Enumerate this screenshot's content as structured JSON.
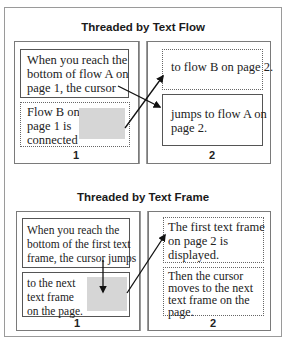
{
  "top_panel": {
    "title": "Threaded by Text Flow",
    "page1": {
      "number": "1",
      "flow_a_text": "When you reach the\nbottom of flow A on\npage 1, the cursor",
      "flow_b_text": "Flow B on\npage 1 is\nconnected"
    },
    "page2": {
      "number": "2",
      "flow_b_text": "to flow B on page 2.",
      "flow_a_text": "jumps to flow A on\npage 2."
    }
  },
  "bottom_panel": {
    "title": "Threaded by Text Frame",
    "page1": {
      "number": "1",
      "frame1_text": "When you reach the\nbottom of the first text\nframe, the cursor jumps",
      "frame2_text": "to the next\ntext frame\non the page."
    },
    "page2": {
      "number": "2",
      "frame1_text": "The first text frame\non page 2 is\ndisplayed.",
      "frame2_text": "Then the cursor\nmoves to the next\ntext frame on the\npage."
    }
  },
  "colors": {
    "border": "#555555",
    "outer_border": "#9a9a9a",
    "placeholder_gray": "#d6d6d6",
    "arrow": "#111111"
  }
}
